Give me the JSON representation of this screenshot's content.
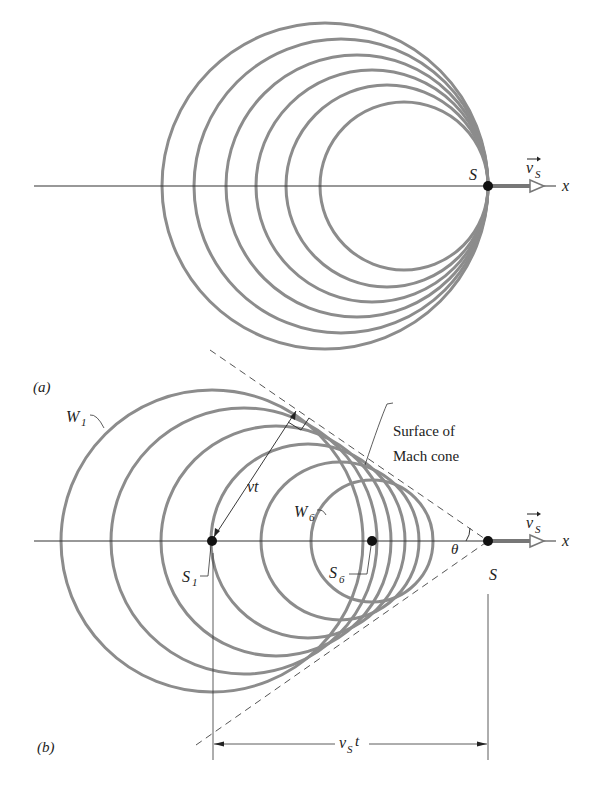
{
  "figure": {
    "panel_a": {
      "label": "(a)",
      "source_label": "S",
      "velocity_label": "v",
      "velocity_sub": "S",
      "axis_label": "x",
      "axis_y": 186,
      "source_x": 488,
      "circles": [
        {
          "cx": 325,
          "r": 163
        },
        {
          "cx": 341,
          "r": 147
        },
        {
          "cx": 357,
          "r": 131
        },
        {
          "cx": 372,
          "r": 116
        },
        {
          "cx": 387,
          "r": 101
        },
        {
          "cx": 404,
          "r": 84
        }
      ]
    },
    "panel_b": {
      "label": "(b)",
      "axis_y": 541,
      "source_x": 488,
      "source_label": "S",
      "s1_label": "S",
      "s1_sub": "1",
      "s6_label": "S",
      "s6_sub": "6",
      "w1_label": "W",
      "w1_sub": "1",
      "w6_label": "W",
      "w6_sub": "6",
      "vt_label": "vt",
      "theta_label": "θ",
      "mach_label_line1": "Surface of",
      "mach_label_line2": "Mach cone",
      "velocity_label": "v",
      "velocity_sub": "S",
      "axis_label": "x",
      "dimension_label": "v",
      "dimension_sub": "S",
      "dimension_suffix": "t",
      "circles": [
        {
          "cx": 212,
          "r": 151
        },
        {
          "cx": 244,
          "r": 133
        },
        {
          "cx": 276,
          "r": 115
        },
        {
          "cx": 308,
          "r": 97
        },
        {
          "cx": 340,
          "r": 79
        },
        {
          "cx": 372,
          "r": 61
        }
      ]
    },
    "colors": {
      "wave": "#8c8c8c",
      "ink": "#222222",
      "dash": "#555555"
    }
  }
}
